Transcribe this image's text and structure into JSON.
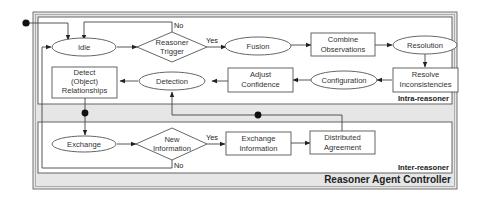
{
  "diagram": {
    "controller": {
      "label": "Reasoner Agent Controller"
    },
    "regions": {
      "intra": {
        "label": "Intra-reasoner"
      },
      "inter": {
        "label": "Inter-reasoner"
      }
    },
    "nodes": {
      "idle": {
        "label": "Idle",
        "shape": "ellipse"
      },
      "reasoner_trigger": {
        "lines": [
          "Reasoner",
          "Trigger"
        ],
        "shape": "diamond"
      },
      "fusion": {
        "label": "Fusion",
        "shape": "ellipse"
      },
      "combine_observations": {
        "lines": [
          "Combine",
          "Observations"
        ],
        "shape": "rect"
      },
      "resolution": {
        "label": "Resolution",
        "shape": "ellipse"
      },
      "resolve_inconsistencies": {
        "lines": [
          "Resolve",
          "Inconsistencies"
        ],
        "shape": "rect"
      },
      "configuration": {
        "label": "Configuration",
        "shape": "ellipse"
      },
      "adjust_confidence": {
        "lines": [
          "Adjust",
          "Confidence"
        ],
        "shape": "rect"
      },
      "detection": {
        "label": "Detection",
        "shape": "ellipse"
      },
      "detect_relationships": {
        "lines": [
          "Detect",
          "(Object)",
          "Relationships"
        ],
        "shape": "rect"
      },
      "exchange": {
        "label": "Exchange",
        "shape": "ellipse"
      },
      "new_information": {
        "lines": [
          "New",
          "Information"
        ],
        "shape": "diamond"
      },
      "exchange_information": {
        "lines": [
          "Exchange",
          "Information"
        ],
        "shape": "rect"
      },
      "distributed_agreement": {
        "lines": [
          "Distributed",
          "Agreement"
        ],
        "shape": "rect"
      }
    },
    "edge_labels": {
      "trigger_yes": "Yes",
      "trigger_no": "No",
      "newinfo_yes": "Yes",
      "newinfo_no": "No"
    },
    "edges": [
      {
        "from": "start",
        "to": "idle"
      },
      {
        "from": "idle",
        "to": "reasoner_trigger"
      },
      {
        "from": "reasoner_trigger",
        "to": "fusion",
        "label": "Yes"
      },
      {
        "from": "reasoner_trigger",
        "to": "idle",
        "label": "No"
      },
      {
        "from": "fusion",
        "to": "combine_observations"
      },
      {
        "from": "combine_observations",
        "to": "resolution"
      },
      {
        "from": "resolution",
        "to": "resolve_inconsistencies"
      },
      {
        "from": "resolve_inconsistencies",
        "to": "configuration"
      },
      {
        "from": "configuration",
        "to": "adjust_confidence"
      },
      {
        "from": "adjust_confidence",
        "to": "detection"
      },
      {
        "from": "detection",
        "to": "detect_relationships"
      },
      {
        "from": "detect_relationships",
        "to": "exchange"
      },
      {
        "from": "exchange",
        "to": "new_information"
      },
      {
        "from": "new_information",
        "to": "exchange_information",
        "label": "Yes"
      },
      {
        "from": "new_information",
        "to": "idle",
        "label": "No"
      },
      {
        "from": "exchange_information",
        "to": "distributed_agreement"
      },
      {
        "from": "distributed_agreement",
        "to": "detection"
      }
    ],
    "colors": {
      "controller_fill": "#e6e6e6",
      "region_fill": "#ffffff",
      "stroke": "#555555"
    }
  }
}
